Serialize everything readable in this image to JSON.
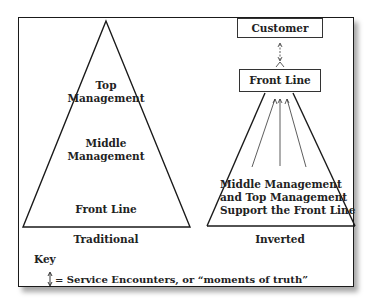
{
  "traditional": {
    "levels": [
      "Top Management",
      "Middle Management",
      "Front Line"
    ],
    "top_label_line1": "Top",
    "top_label_line2": "Management",
    "middle_label_line1": "Middle",
    "middle_label_line2": "Management",
    "bottom_label": "Front Line",
    "caption": "Traditional"
  },
  "inverted": {
    "customer_label": "Customer",
    "front_line_label": "Front Line",
    "support_line1": "Middle Management",
    "support_line2": "and Top Management",
    "support_line3": "Support the Front Line",
    "caption": "Inverted"
  },
  "key": {
    "title": "Key",
    "symbol": "↕",
    "description": "= Service Encounters, or “moments of truth”"
  },
  "colors": {
    "line": "#1a1a1a",
    "text": "#222222",
    "background": "#ffffff"
  }
}
